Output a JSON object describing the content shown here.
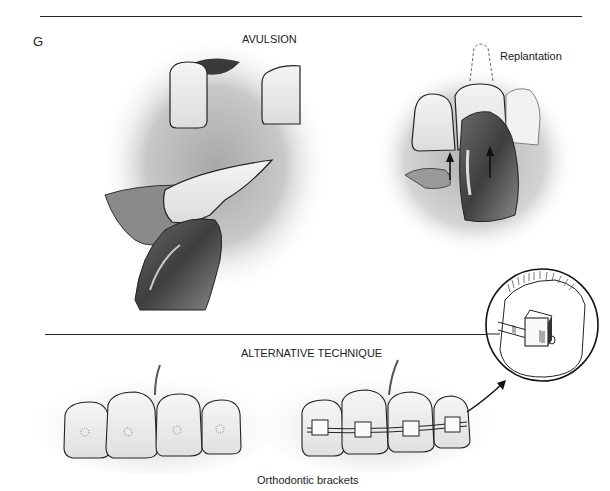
{
  "figure": {
    "panel_letter": "G",
    "sections": [
      {
        "title": "AVULSION",
        "illustrations": [
          {
            "name": "avulsed-tooth-held-by-finger",
            "description": "Gap between incisors with bleeding socket; avulsed tooth held between fingers"
          },
          {
            "name": "replantation",
            "label": "Replantation",
            "description": "Tooth pushed back into socket with thumb; arrows indicate upward direction"
          }
        ]
      },
      {
        "title": "ALTERNATIVE TECHNIQUE",
        "illustrations": [
          {
            "name": "teeth-with-bonding-sites",
            "description": "Four anterior teeth with stippled bonding areas"
          },
          {
            "name": "teeth-with-brackets",
            "label": "Orthodontic brackets",
            "description": "Four teeth with brackets and archwire"
          },
          {
            "name": "bracket-detail-inset",
            "description": "Circular magnified view of bracket with wire"
          }
        ]
      }
    ],
    "labels": {
      "avulsion": "AVULSION",
      "replantation": "Replantation",
      "alternative": "ALTERNATIVE TECHNIQUE",
      "brackets": "Orthodontic brackets"
    },
    "colors": {
      "ink": "#222222",
      "shade_dark": "#4a4a4a",
      "shade_mid": "#9a9a9a",
      "shade_light": "#d8d8d8",
      "background": "#ffffff"
    }
  }
}
